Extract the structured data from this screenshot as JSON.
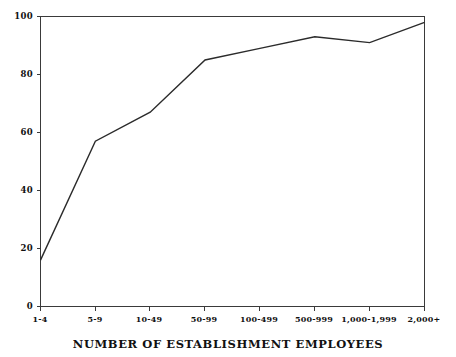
{
  "chart_data": {
    "type": "line",
    "title": "",
    "xlabel": "NUMBER OF ESTABLISHMENT EMPLOYEES",
    "ylabel": "",
    "categories": [
      "1-4",
      "5-9",
      "10-49",
      "50-99",
      "100-499",
      "500-999",
      "1,000-1,999",
      "2,000+"
    ],
    "values": [
      16,
      57,
      67,
      85,
      89,
      93,
      91,
      98
    ],
    "ylim": [
      0,
      100
    ],
    "yticks": [
      0,
      20,
      40,
      60,
      80,
      100
    ],
    "ytick_labels": [
      "0",
      "20",
      "40",
      "60",
      "80",
      "100"
    ],
    "grid": false,
    "legend": null,
    "line_color": "#2b2b2b",
    "axis_color": "#3a3a3a",
    "background_color": "#ffffff"
  },
  "axes": {
    "x_axis_title": "NUMBER OF ESTABLISHMENT EMPLOYEES",
    "y_axis_title": ""
  }
}
